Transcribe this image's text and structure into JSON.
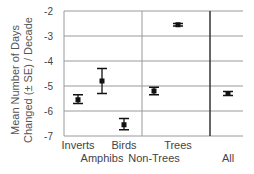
{
  "chart_data": {
    "type": "scatter",
    "title": "",
    "xlabel": "",
    "ylabel": "Mean Number of Days Changed (± SE) / Decade",
    "ylabel_lines": [
      "Mean Number of Days",
      "Changed (± SE)  / Decade"
    ],
    "ylim": [
      -7,
      -2
    ],
    "yticks": [
      -2,
      -3,
      -4,
      -5,
      -6,
      -7
    ],
    "ytick_labels": [
      "-2",
      "-3",
      "-4",
      "-5",
      "-6",
      "-7"
    ],
    "grid": true,
    "legend": "none",
    "categories": [
      "Inverts",
      "Amphibs",
      "Birds",
      "Non-Trees",
      "Trees",
      "All"
    ],
    "series": [
      {
        "name": "Mean ± SE",
        "values": [
          -5.55,
          -4.8,
          -6.55,
          -5.2,
          -2.55,
          -5.3
        ],
        "se_upper": [
          -5.35,
          -4.3,
          -6.3,
          -5.05,
          -2.5,
          -5.22
        ],
        "se_lower": [
          -5.7,
          -5.3,
          -6.75,
          -5.35,
          -2.6,
          -5.38
        ]
      }
    ],
    "groups": [
      {
        "name": "Animals",
        "categories": [
          "Inverts",
          "Amphibs",
          "Birds"
        ]
      },
      {
        "name": "Plants",
        "categories": [
          "Non-Trees",
          "Trees"
        ]
      },
      {
        "name": "Overall",
        "categories": [
          "All"
        ]
      }
    ]
  }
}
